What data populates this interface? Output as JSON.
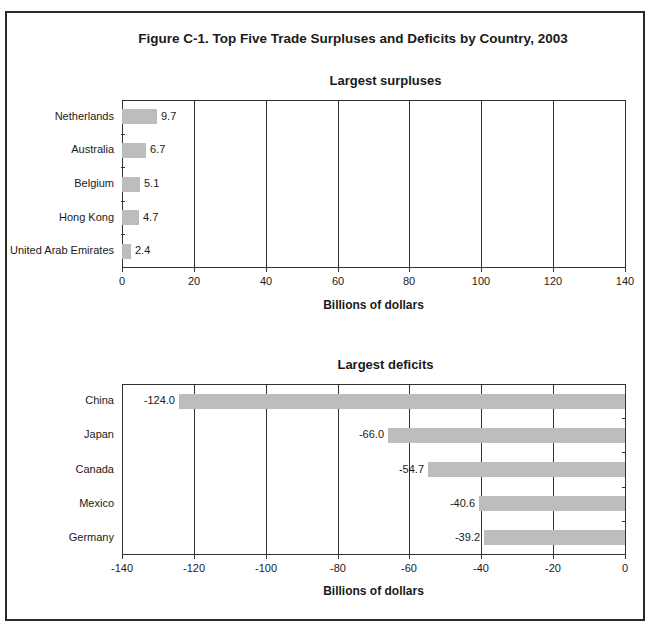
{
  "figure_title": "Figure C-1. Top Five Trade Surpluses and Deficits by Country, 2003",
  "colors": {
    "bar": "#bdbdbd",
    "axis": "#333333",
    "frame": "#2a2a2a"
  },
  "chart_data": [
    {
      "type": "bar",
      "orientation": "horizontal",
      "title": "Largest surpluses",
      "categories": [
        "Netherlands",
        "Australia",
        "Belgium",
        "Hong Kong",
        "United Arab Emirates"
      ],
      "values": [
        9.7,
        6.7,
        5.1,
        4.7,
        2.4
      ],
      "value_labels": [
        "9.7",
        "6.7",
        "5.1",
        "4.7",
        "2.4"
      ],
      "xlabel": "Billions of dollars",
      "ylabel": "",
      "xlim": [
        0,
        140
      ],
      "xticks": [
        "0",
        "20",
        "40",
        "60",
        "80",
        "100",
        "120",
        "140"
      ],
      "grid": true
    },
    {
      "type": "bar",
      "orientation": "horizontal",
      "title": "Largest deficits",
      "categories": [
        "China",
        "Japan",
        "Canada",
        "Mexico",
        "Germany"
      ],
      "values": [
        -124.0,
        -66.0,
        -54.7,
        -40.6,
        -39.2
      ],
      "value_labels": [
        "-124.0",
        "-66.0",
        "-54.7",
        "-40.6",
        "-39.2"
      ],
      "xlabel": "Billions of dollars",
      "ylabel": "",
      "xlim": [
        -140,
        0
      ],
      "xticks": [
        "-140",
        "-120",
        "-100",
        "-80",
        "-60",
        "-40",
        "-20",
        "0"
      ],
      "grid": true
    }
  ]
}
